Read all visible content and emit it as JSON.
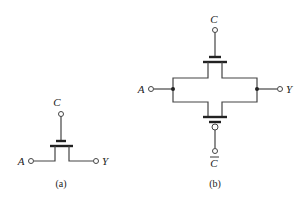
{
  "figure": {
    "a": {
      "caption": "(a)",
      "labels": {
        "gate": "C",
        "input": "A",
        "output": "Y"
      },
      "description": "Single NMOS pass transistor switch"
    },
    "b": {
      "caption": "(b)",
      "labels": {
        "gate_top": "C",
        "gate_bottom": "C",
        "input": "A",
        "output": "Y"
      },
      "description": "CMOS transmission gate: NMOS gated by C in parallel with PMOS gated by C-bar"
    }
  },
  "colors": {
    "line": "#444444",
    "text": "#222222",
    "background": "#ffffff"
  }
}
